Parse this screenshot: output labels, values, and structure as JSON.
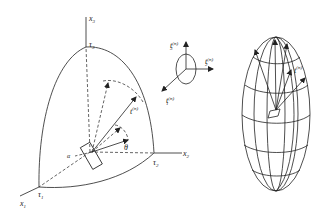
{
  "figure": {
    "left_panel": {
      "axes": {
        "x1": {
          "base": "x",
          "sub": "1"
        },
        "x2": {
          "base": "x",
          "sub": "2"
        },
        "x3": {
          "base": "x",
          "sub": "3"
        }
      },
      "intercepts": {
        "tau1": {
          "base": "τ",
          "sub": "1"
        },
        "tau2": {
          "base": "τ",
          "sub": "2"
        },
        "tau3": {
          "base": "τ",
          "sub": "3"
        }
      },
      "traction_label": {
        "base": "t",
        "sup": "(n)"
      },
      "angle_label": "θ",
      "alpha_label": "α"
    },
    "middle_panel": {
      "t1": {
        "base": "t",
        "sub": "1",
        "sup": "(n)"
      },
      "t2": {
        "base": "t",
        "sub": "2",
        "sup": "(n)"
      },
      "t3": {
        "base": "t",
        "sub": "3",
        "sup": "(n)"
      }
    },
    "right_panel": {
      "traction_label": {
        "base": "t",
        "sup": "(n)"
      }
    }
  }
}
